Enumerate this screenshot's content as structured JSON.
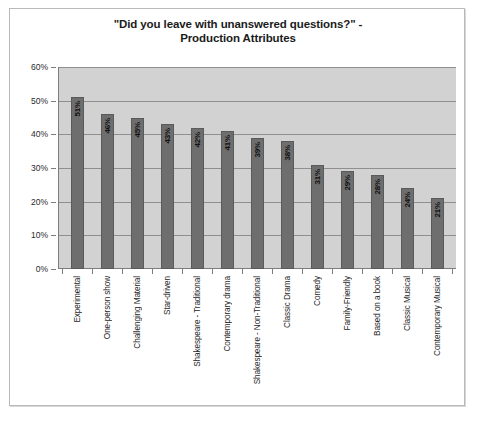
{
  "chart_data": {
    "type": "bar",
    "title": "\"Did you leave with unanswered questions?\" - Production Attributes",
    "title_line1": "\"Did you leave with unanswered questions?\" -",
    "title_line2": "Production Attributes",
    "xlabel": "",
    "ylabel": "",
    "ylim": [
      0,
      60
    ],
    "ytick_labels": [
      "60%",
      "50%",
      "40%",
      "30%",
      "20%",
      "10%",
      "0%"
    ],
    "ytick_values": [
      60,
      50,
      40,
      30,
      20,
      10,
      0
    ],
    "grid": true,
    "legend": "none",
    "categories": [
      "Experimental",
      "One-person show",
      "Challenging Material",
      "Star-driven",
      "Shakespeare - Traditional",
      "Contemporary drama",
      "Shakespeare - Non-Traditional",
      "Classic Drama",
      "Comedy",
      "Family-Friendly",
      "Based on a book",
      "Classic Musical",
      "Contemporary Musical"
    ],
    "values": [
      51,
      46,
      45,
      43,
      42,
      41,
      39,
      38,
      31,
      29,
      28,
      24,
      21
    ],
    "value_labels": [
      "51%",
      "46%",
      "45%",
      "43%",
      "42%",
      "41%",
      "39%",
      "38%",
      "31%",
      "29%",
      "28%",
      "24%",
      "21%"
    ],
    "colors": {
      "bar_fill": "#6e6e6e",
      "bar_border": "#5a5a5a",
      "plot_background": "#d2d2d2",
      "gridline": "#8f8f8f",
      "axis": "#7d7d7d",
      "frame_border": "#b9b9b9",
      "text": "#1b1b1b",
      "page_background": "#ffffff"
    }
  }
}
